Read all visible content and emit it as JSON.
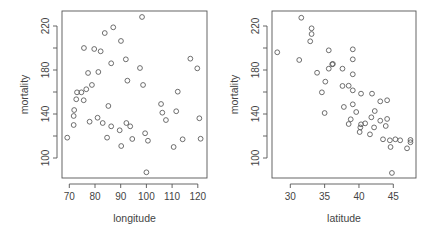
{
  "chart_data": [
    {
      "type": "scatter",
      "title": "",
      "xlabel": "longitude",
      "ylabel": "mortality",
      "xlim": [
        68,
        122.5
      ],
      "ylim": [
        80,
        232
      ],
      "xticks": [
        70,
        80,
        90,
        100,
        110,
        120
      ],
      "yticks": [
        100,
        140,
        180,
        220
      ],
      "ytick_labels": [
        "100",
        "140",
        "180",
        "220"
      ],
      "xtick_labels": [
        "70",
        "80",
        "90",
        "100",
        "110",
        "120"
      ],
      "grid": false,
      "marker": "open-circle",
      "points": [
        [
          87.1,
          218.8
        ],
        [
          83.8,
          213.6
        ],
        [
          90.1,
          206.4
        ],
        [
          75.7,
          200.0
        ],
        [
          79.7,
          199.1
        ],
        [
          82.2,
          197.0
        ],
        [
          92.0,
          189.7
        ],
        [
          86.3,
          186.1
        ],
        [
          77.3,
          177.3
        ],
        [
          81.3,
          178.2
        ],
        [
          92.6,
          170.3
        ],
        [
          78.8,
          166.4
        ],
        [
          76.6,
          162.5
        ],
        [
          74.7,
          159.7
        ],
        [
          73.0,
          159.7
        ],
        [
          72.7,
          153.4
        ],
        [
          75.6,
          152.5
        ],
        [
          71.9,
          143.6
        ],
        [
          85.2,
          147.3
        ],
        [
          71.7,
          138.2
        ],
        [
          81.0,
          136.6
        ],
        [
          71.7,
          130.0
        ],
        [
          77.9,
          133.0
        ],
        [
          83.0,
          131.8
        ],
        [
          86.3,
          128.8
        ],
        [
          92.2,
          131.8
        ],
        [
          93.7,
          128.8
        ],
        [
          69.2,
          118.5
        ],
        [
          84.7,
          118.5
        ],
        [
          89.6,
          125.2
        ],
        [
          94.5,
          117.3
        ],
        [
          90.2,
          110.9
        ],
        [
          98.3,
          228.2
        ],
        [
          117.1,
          190.3
        ],
        [
          119.8,
          181.5
        ],
        [
          97.5,
          181.8
        ],
        [
          98.7,
          166.4
        ],
        [
          112.2,
          160.3
        ],
        [
          105.7,
          149.1
        ],
        [
          106.2,
          141.2
        ],
        [
          111.6,
          142.5
        ],
        [
          107.6,
          134.5
        ],
        [
          120.6,
          136.1
        ],
        [
          99.5,
          122.5
        ],
        [
          100.6,
          115.7
        ],
        [
          114.1,
          117.0
        ],
        [
          121.1,
          117.5
        ],
        [
          110.6,
          110.0
        ],
        [
          100.0,
          87.0
        ]
      ]
    },
    {
      "type": "scatter",
      "title": "",
      "xlabel": "latitude",
      "ylabel": "mortality",
      "xlim": [
        27.5,
        48.5
      ],
      "ylim": [
        80,
        232
      ],
      "xticks": [
        30,
        35,
        40,
        45
      ],
      "yticks": [
        100,
        140,
        180,
        220
      ],
      "ytick_labels": [
        "100",
        "140",
        "180",
        "220"
      ],
      "xtick_labels": [
        "30",
        "35",
        "40",
        "45"
      ],
      "grid": false,
      "marker": "open-circle",
      "points": [
        [
          31.6,
          227.5
        ],
        [
          33.1,
          217.9
        ],
        [
          33.1,
          212.7
        ],
        [
          32.9,
          206.1
        ],
        [
          28.1,
          196.1
        ],
        [
          35.6,
          197.9
        ],
        [
          31.3,
          189.1
        ],
        [
          36.1,
          185.2
        ],
        [
          35.6,
          181.2
        ],
        [
          37.6,
          181.2
        ],
        [
          33.9,
          177.5
        ],
        [
          35.1,
          169.4
        ],
        [
          37.6,
          165.5
        ],
        [
          34.6,
          159.7
        ],
        [
          39.1,
          198.8
        ],
        [
          39.1,
          189.7
        ],
        [
          36.2,
          185.5
        ],
        [
          39.1,
          176.1
        ],
        [
          38.5,
          165.7
        ],
        [
          39.1,
          161.5
        ],
        [
          40.3,
          158.5
        ],
        [
          41.9,
          158.5
        ],
        [
          43.1,
          151.5
        ],
        [
          44.1,
          152.5
        ],
        [
          37.8,
          146.4
        ],
        [
          39.1,
          148.8
        ],
        [
          39.6,
          141.8
        ],
        [
          42.3,
          142.7
        ],
        [
          38.8,
          135.2
        ],
        [
          38.5,
          130.9
        ],
        [
          41.8,
          137.0
        ],
        [
          43.1,
          133.9
        ],
        [
          44.1,
          135.5
        ],
        [
          40.3,
          130.6
        ],
        [
          40.9,
          131.5
        ],
        [
          40.2,
          127.8
        ],
        [
          40.1,
          123.6
        ],
        [
          42.2,
          127.8
        ],
        [
          43.9,
          129.1
        ],
        [
          41.6,
          121.5
        ],
        [
          43.5,
          117.0
        ],
        [
          44.5,
          116.1
        ],
        [
          45.3,
          117.0
        ],
        [
          46.0,
          116.1
        ],
        [
          44.6,
          110.0
        ],
        [
          47.0,
          108.8
        ],
        [
          47.5,
          116.4
        ],
        [
          47.5,
          114.3
        ],
        [
          44.8,
          86.4
        ],
        [
          35.0,
          140.9
        ]
      ]
    }
  ]
}
